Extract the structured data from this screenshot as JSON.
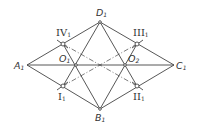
{
  "diagram": {
    "type": "geometric construction",
    "stroke_color": "#444444",
    "points": {
      "A1": {
        "x": 27,
        "y": 65,
        "label": "A",
        "sub": "1"
      },
      "B1": {
        "x": 100,
        "y": 109,
        "label": "B",
        "sub": "1"
      },
      "C1": {
        "x": 174,
        "y": 65,
        "label": "C",
        "sub": "1"
      },
      "D1": {
        "x": 100,
        "y": 22,
        "label": "D",
        "sub": "1"
      },
      "O1": {
        "x": 76,
        "y": 65,
        "label": "O",
        "sub": "1"
      },
      "O2": {
        "x": 125,
        "y": 65,
        "label": "O",
        "sub": "2"
      },
      "I1": {
        "x": 63,
        "y": 86,
        "label": "I",
        "sub": "1"
      },
      "II1": {
        "x": 137,
        "y": 86,
        "label": "II",
        "sub": "1"
      },
      "III1": {
        "x": 137,
        "y": 44,
        "label": "III",
        "sub": "1"
      },
      "IV1": {
        "x": 63,
        "y": 44,
        "label": "IV",
        "sub": "1"
      }
    },
    "solid_lines": [
      [
        "A1",
        "D1"
      ],
      [
        "D1",
        "C1"
      ],
      [
        "C1",
        "B1"
      ],
      [
        "B1",
        "A1"
      ],
      [
        "A1",
        "C1"
      ],
      [
        "D1",
        "I1"
      ],
      [
        "D1",
        "II1"
      ],
      [
        "B1",
        "IV1"
      ],
      [
        "B1",
        "III1"
      ]
    ],
    "dashed_lines": [
      [
        "IV1",
        "II1"
      ],
      [
        "I1",
        "III1"
      ]
    ]
  }
}
